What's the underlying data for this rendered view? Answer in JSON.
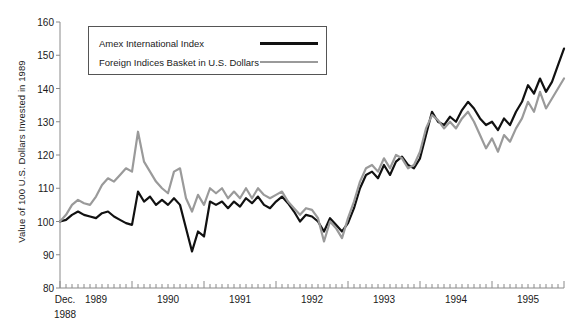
{
  "chart_data": {
    "type": "line",
    "title": "",
    "xlabel": "",
    "ylabel": "Value of 100 U.S. Dollars Invested in 1989",
    "ylim": [
      80,
      160
    ],
    "yticks": [
      80,
      90,
      100,
      110,
      120,
      130,
      140,
      150,
      160
    ],
    "grid": false,
    "legend_position": "top-left-inside",
    "x_start_label": "Dec.",
    "x_start_label2": "1988",
    "xtick_years": [
      "1989",
      "1990",
      "1991",
      "1992",
      "1993",
      "1994",
      "1995"
    ],
    "x_minor_ticks_per_year": 12,
    "x_axis_range_months": [
      0,
      84
    ],
    "x": [
      "Dec 1988",
      "Jan 1989",
      "Feb 1989",
      "Mar 1989",
      "Apr 1989",
      "May 1989",
      "Jun 1989",
      "Jul 1989",
      "Aug 1989",
      "Sep 1989",
      "Oct 1989",
      "Nov 1989",
      "Dec 1989",
      "Jan 1990",
      "Feb 1990",
      "Mar 1990",
      "Apr 1990",
      "May 1990",
      "Jun 1990",
      "Jul 1990",
      "Aug 1990",
      "Sep 1990",
      "Oct 1990",
      "Nov 1990",
      "Dec 1990",
      "Jan 1991",
      "Feb 1991",
      "Mar 1991",
      "Apr 1991",
      "May 1991",
      "Jun 1991",
      "Jul 1991",
      "Aug 1991",
      "Sep 1991",
      "Oct 1991",
      "Nov 1991",
      "Dec 1991",
      "Jan 1992",
      "Feb 1992",
      "Mar 1992",
      "Apr 1992",
      "May 1992",
      "Jun 1992",
      "Jul 1992",
      "Aug 1992",
      "Sep 1992",
      "Oct 1992",
      "Nov 1992",
      "Dec 1992",
      "Jan 1993",
      "Feb 1993",
      "Mar 1993",
      "Apr 1993",
      "May 1993",
      "Jun 1993",
      "Jul 1993",
      "Aug 1993",
      "Sep 1993",
      "Oct 1993",
      "Nov 1993",
      "Dec 1993",
      "Jan 1994",
      "Feb 1994",
      "Mar 1994",
      "Apr 1994",
      "May 1994",
      "Jun 1994",
      "Jul 1994",
      "Aug 1994",
      "Sep 1994",
      "Oct 1994",
      "Nov 1994",
      "Dec 1994",
      "Jan 1995",
      "Feb 1995",
      "Mar 1995",
      "Apr 1995",
      "May 1995",
      "Jun 1995",
      "Jul 1995",
      "Aug 1995",
      "Sep 1995",
      "Oct 1995",
      "Nov 1995",
      "Dec 1995"
    ],
    "series": [
      {
        "name": "Amex International Index",
        "color": "#111111",
        "width": 2.2,
        "values": [
          100,
          100.5,
          102,
          103,
          102,
          101.5,
          101,
          102.5,
          103,
          101.5,
          100.5,
          99.5,
          99,
          109,
          106,
          107.5,
          105,
          106.5,
          105,
          107,
          105,
          98,
          91,
          97,
          95.5,
          106,
          105,
          106,
          104,
          106,
          104.5,
          107,
          105.5,
          107.5,
          105,
          104,
          106,
          107.5,
          105.5,
          103,
          100,
          102,
          101.5,
          100,
          97,
          101,
          99,
          97,
          99.5,
          104,
          110,
          114,
          115,
          113,
          117,
          114,
          118,
          119.5,
          117,
          116,
          119,
          126,
          133,
          130,
          129,
          131.5,
          130,
          133.5,
          136,
          134,
          131,
          129,
          130,
          127.5,
          131,
          129,
          133,
          136,
          141,
          138.5,
          143,
          139,
          142,
          147,
          152
        ]
      },
      {
        "name": "Foreign Indices Basket in U.S. Dollars",
        "color": "#9a9a9a",
        "width": 2.2,
        "values": [
          100,
          102,
          105,
          106.5,
          105.5,
          105,
          107.5,
          111,
          113,
          112,
          114,
          116,
          115,
          127,
          118,
          115,
          112,
          110,
          108.5,
          115,
          116,
          107,
          103,
          108,
          105,
          110,
          108.5,
          110,
          107,
          109,
          107,
          110,
          107,
          110,
          108,
          107,
          108,
          109,
          106,
          104,
          102,
          104,
          103.5,
          101,
          94,
          100,
          98,
          95,
          101,
          106,
          112,
          116,
          117,
          115,
          119,
          116,
          120,
          119,
          116,
          117,
          121,
          128,
          132,
          130.5,
          128,
          130,
          128,
          131,
          133,
          130,
          126,
          122,
          125,
          121,
          126,
          124,
          128,
          131,
          136,
          133,
          139,
          134,
          137,
          140,
          143
        ]
      }
    ]
  },
  "legend": {
    "items": [
      {
        "label": "Amex International Index",
        "color": "#111111",
        "width": 3.4
      },
      {
        "label": "Foreign Indices Basket in U.S. Dollars",
        "color": "#9a9a9a",
        "width": 2.2
      }
    ]
  },
  "axes": {
    "y_title": "Value of 100 U.S. Dollars Invested in 1989",
    "y_tick_labels": [
      "160",
      "150",
      "140",
      "130",
      "120",
      "110",
      "100",
      "90",
      "80"
    ],
    "x_origin_label_line1": "Dec.",
    "x_origin_label_line2": "1988",
    "x_year_labels": [
      "1989",
      "1990",
      "1991",
      "1992",
      "1993",
      "1994",
      "1995"
    ]
  },
  "colors": {
    "series_a": "#111111",
    "series_b": "#9a9a9a",
    "axis": "#8a8a8a",
    "text": "#1a1a1a",
    "background": "#ffffff",
    "legend_border": "#555555"
  }
}
